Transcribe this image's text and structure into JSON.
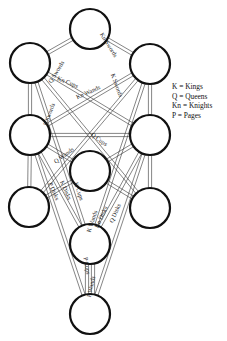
{
  "diagram": {
    "colors": {
      "line": "#333333",
      "node_stroke": "#111111",
      "text": "#222222",
      "background": "#ffffff"
    },
    "node_radius": 20,
    "nodes": [
      {
        "id": "n1",
        "x": 90,
        "y": 29
      },
      {
        "id": "n2",
        "x": 150,
        "y": 64
      },
      {
        "id": "n3",
        "x": 30,
        "y": 63
      },
      {
        "id": "n4",
        "x": 150,
        "y": 135
      },
      {
        "id": "n5",
        "x": 30,
        "y": 135
      },
      {
        "id": "n6",
        "x": 90,
        "y": 171
      },
      {
        "id": "n7",
        "x": 150,
        "y": 208
      },
      {
        "id": "n8",
        "x": 29,
        "y": 207
      },
      {
        "id": "n9",
        "x": 90,
        "y": 244
      },
      {
        "id": "n10",
        "x": 90,
        "y": 314
      }
    ],
    "paths": [
      {
        "from": "n1",
        "to": "n3",
        "label": "Q Swords"
      },
      {
        "from": "n1",
        "to": "n2",
        "label": "Kn Swords"
      },
      {
        "from": "n3",
        "to": "n4",
        "label": "Kn Cups"
      },
      {
        "from": "n2",
        "to": "n5",
        "label": "Kn Wands"
      },
      {
        "from": "n3",
        "to": "n7",
        "label": "P Swords"
      },
      {
        "from": "n2",
        "to": "n8",
        "label": "K Swords"
      },
      {
        "from": "n5",
        "to": "n4",
        "label": ""
      },
      {
        "from": "n5",
        "to": "n9",
        "label": "Q Wands"
      },
      {
        "from": "n4",
        "to": "n9",
        "label": "Q Cups"
      },
      {
        "from": "n3",
        "to": "n5",
        "label": ""
      },
      {
        "from": "n2",
        "to": "n4",
        "label": ""
      },
      {
        "from": "n5",
        "to": "n8",
        "label": ""
      },
      {
        "from": "n4",
        "to": "n7",
        "label": ""
      },
      {
        "from": "n3",
        "to": "n9",
        "label": "P Disks"
      },
      {
        "from": "n5",
        "to": "n7",
        "label": "K Disks"
      },
      {
        "from": "n5",
        "to": "n10",
        "label": "K Cups"
      },
      {
        "from": "n4",
        "to": "n10",
        "label": "K Wands"
      },
      {
        "from": "n4",
        "to": "n8",
        "label": "Kn Disks"
      },
      {
        "from": "n2",
        "to": "n9",
        "label": "Q Disks"
      },
      {
        "from": "n9",
        "to": "n10",
        "label": "P Cups"
      },
      {
        "from": "n9",
        "to": "n10",
        "label": "P Wands"
      }
    ],
    "labels": [
      {
        "text": "Q Swords",
        "x": 58,
        "y": 73,
        "angle": -58
      },
      {
        "text": "Kn Swords",
        "x": 107,
        "y": 46,
        "angle": 58
      },
      {
        "text": "Kn Cups",
        "x": 67,
        "y": 84,
        "angle": 22
      },
      {
        "text": "Kn Wands",
        "x": 89,
        "y": 94,
        "angle": -24
      },
      {
        "text": "P Swords",
        "x": 51,
        "y": 115,
        "angle": -70
      },
      {
        "text": "K Swords",
        "x": 115,
        "y": 86,
        "angle": 70
      },
      {
        "text": "Q Wands",
        "x": 65,
        "y": 157,
        "angle": -36
      },
      {
        "text": "Q Cups",
        "x": 98,
        "y": 141,
        "angle": 36
      },
      {
        "text": "P Disks",
        "x": 52,
        "y": 192,
        "angle": 66
      },
      {
        "text": "K Disks",
        "x": 64,
        "y": 191,
        "angle": 66
      },
      {
        "text": "K Cups",
        "x": 77,
        "y": 192,
        "angle": 72
      },
      {
        "text": "K Wands",
        "x": 94,
        "y": 222,
        "angle": -72
      },
      {
        "text": "Kn Disks",
        "x": 103,
        "y": 218,
        "angle": -66
      },
      {
        "text": "Q Disks",
        "x": 117,
        "y": 214,
        "angle": -66
      },
      {
        "text": "P Cups",
        "x": 85,
        "y": 266,
        "angle": 80
      },
      {
        "text": "P Wands",
        "x": 93,
        "y": 287,
        "angle": -78
      }
    ]
  },
  "legend": {
    "items": [
      {
        "key": "K",
        "meaning": "Kings",
        "text": "K = Kings"
      },
      {
        "key": "Q",
        "meaning": "Queens",
        "text": "Q = Queens"
      },
      {
        "key": "Kn",
        "meaning": "Knights",
        "text": "Kn = Knights"
      },
      {
        "key": "P",
        "meaning": "Pages",
        "text": "P = Pages"
      }
    ]
  }
}
